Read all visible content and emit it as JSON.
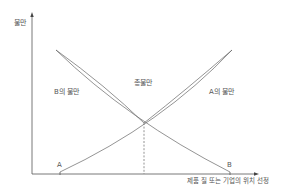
{
  "diagram": {
    "y_axis_label": "불만",
    "x_axis_label": "제품 질 또는 기업의 위치 선정",
    "curve_labels": {
      "b_dissatisfaction": "B의 불만",
      "a_dissatisfaction": "A의 불만",
      "total_dissatisfaction": "총불만"
    },
    "point_labels": {
      "a": "A",
      "b": "B"
    },
    "colors": {
      "axis": "#555555",
      "curve": "#666666",
      "text": "#555555",
      "background": "#ffffff"
    }
  }
}
